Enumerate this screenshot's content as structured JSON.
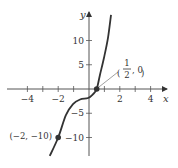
{
  "chart_data": {
    "type": "line",
    "title": "",
    "xlabel": "x",
    "ylabel": "y",
    "xlim": [
      -4.6,
      5
    ],
    "ylim": [
      -14,
      16.5
    ],
    "x_ticks": [
      -4,
      -3,
      -2,
      -1,
      1,
      2,
      3,
      4
    ],
    "x_tick_labels": [
      {
        "value": -4,
        "label": "−4"
      },
      {
        "value": -2,
        "label": "−2"
      },
      {
        "value": 2,
        "label": "2"
      },
      {
        "value": 4,
        "label": "4"
      }
    ],
    "y_ticks": [
      -10,
      -5,
      5,
      10
    ],
    "y_tick_labels": [
      {
        "value": 10,
        "label": "10"
      },
      {
        "value": 5,
        "label": "5"
      },
      {
        "value": -5,
        "label": "−5"
      },
      {
        "value": -10,
        "label": "−10"
      }
    ],
    "grid": false,
    "series": [
      {
        "name": "f(x)",
        "color": "#333333",
        "points": [
          [
            -2.55,
            -13.8
          ],
          [
            -2.0,
            -10.0
          ],
          [
            -1.5,
            -5.4
          ],
          [
            -1.04,
            -3.1
          ],
          [
            -0.58,
            -2.16
          ],
          [
            -0.06,
            -1.86
          ],
          [
            0.25,
            -1.1
          ],
          [
            0.5,
            0
          ],
          [
            0.71,
            2.9
          ],
          [
            0.97,
            6.4
          ],
          [
            1.23,
            10.5
          ],
          [
            1.43,
            15.3
          ]
        ]
      }
    ],
    "highlighted_points": [
      {
        "x": -2,
        "y": -10,
        "label": "(−2, −10)"
      },
      {
        "x": 0.5,
        "y": 0,
        "label_num": "1",
        "label_den": "2",
        "label_rest": ", 0",
        "label_open": "(",
        "label_close": ")"
      }
    ]
  }
}
